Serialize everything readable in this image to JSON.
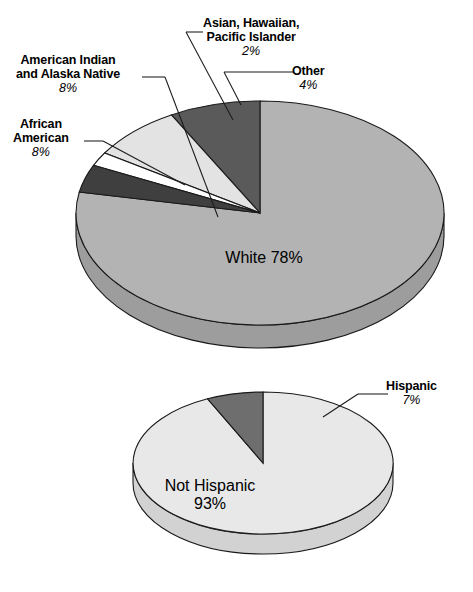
{
  "chart_data": [
    {
      "type": "pie",
      "title": "",
      "id": "race-pie",
      "legend_position": "callout-labels",
      "categories": [
        "White",
        "Other",
        "Asian, Hawaiian, Pacific Islander",
        "American Indian and Alaska Native",
        "African American"
      ],
      "values": [
        78,
        4,
        2,
        8,
        8
      ],
      "labels": [
        {
          "name": "White",
          "pct": "78%",
          "value": 78,
          "color": "#b3b3b3",
          "placement": "inside"
        },
        {
          "name": "Other",
          "pct": "4%",
          "value": 4,
          "color": "#3f3f3f",
          "placement": "callout"
        },
        {
          "name": "Asian, Hawaiian,",
          "name2": "Pacific Islander",
          "pct": "2%",
          "value": 2,
          "color": "#ffffff",
          "placement": "callout"
        },
        {
          "name": "American Indian",
          "name2": "and Alaska Native",
          "pct": "8%",
          "value": 8,
          "color": "#e3e3e3",
          "placement": "callout"
        },
        {
          "name": "African",
          "name2": "American",
          "pct": "8%",
          "value": 8,
          "color": "#5a5a5a",
          "placement": "callout"
        }
      ]
    },
    {
      "type": "pie",
      "title": "",
      "id": "ethnicity-pie",
      "legend_position": "callout-labels",
      "categories": [
        "Not Hispanic",
        "Hispanic"
      ],
      "values": [
        93,
        7
      ],
      "labels": [
        {
          "name": "Not Hispanic",
          "pct": "93%",
          "value": 93,
          "color": "#e8e8e8",
          "placement": "inside"
        },
        {
          "name": "Hispanic",
          "pct": "7%",
          "value": 7,
          "color": "#6e6e6e",
          "placement": "callout"
        }
      ]
    }
  ],
  "colors": {
    "white_slice": "#b3b3b3",
    "other_slice": "#3f3f3f",
    "asian_slice": "#ffffff",
    "american_indian_slice": "#e3e3e3",
    "african_american_slice": "#5a5a5a",
    "not_hispanic_slice": "#e8e8e8",
    "hispanic_slice": "#6e6e6e",
    "outline": "#1a1a1a",
    "background": "#ffffff"
  },
  "pie1": {
    "white": {
      "name": "White",
      "pct": "78%"
    },
    "other": {
      "name": "Other",
      "pct": "4%"
    },
    "asian": {
      "line1": "Asian, Hawaiian,",
      "line2": "Pacific Islander",
      "pct": "2%"
    },
    "american_indian": {
      "line1": "American Indian",
      "line2": "and Alaska Native",
      "pct": "8%"
    },
    "african_american": {
      "line1": "African",
      "line2": "American",
      "pct": "8%"
    }
  },
  "pie2": {
    "not_hispanic": {
      "name": "Not Hispanic",
      "pct": "93%"
    },
    "hispanic": {
      "name": "Hispanic",
      "pct": "7%"
    }
  }
}
